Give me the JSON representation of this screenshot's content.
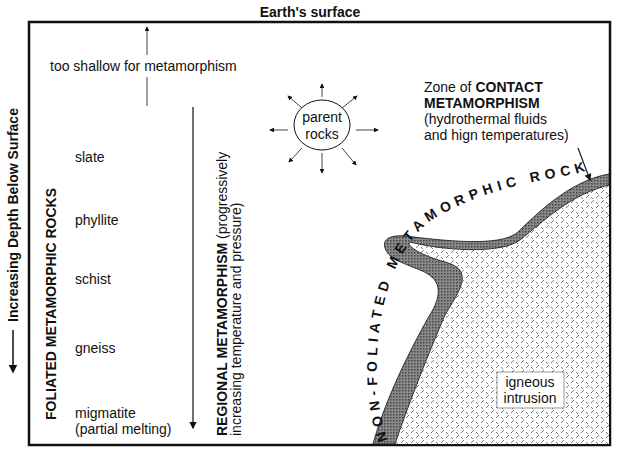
{
  "title": "Earth's surface",
  "depth_axis": {
    "label": "Increasing Depth Below Surface"
  },
  "shallow_note": "too shallow for metamorphism",
  "foliated": {
    "heading": "FOLIATED METAMORPHIC ROCKS",
    "rocks": [
      "slate",
      "phyllite",
      "schist",
      "gneiss",
      "migmatite"
    ],
    "migmatite_note": "(partial melting)"
  },
  "regional": {
    "bold": "REGIONAL METAMORPHISM",
    "line1_rest": " (progressively",
    "line2": "increasing temperature and pressure)"
  },
  "parent_rocks": {
    "line1": "parent",
    "line2": "rocks"
  },
  "contact": {
    "line1_prefix": "Zone of ",
    "line1_bold": "CONTACT",
    "line2_bold": "METAMORPHISM",
    "line3": "(hydrothermal fluids",
    "line4": "and hign temperatures)"
  },
  "nonfoliated": {
    "label": "NON-FOLIATED METAMORPHIC ROCKS"
  },
  "igneous": {
    "line1": "igneous",
    "line2": "intrusion"
  },
  "colors": {
    "aureole": "#777777",
    "line": "#111111",
    "background": "#ffffff"
  }
}
